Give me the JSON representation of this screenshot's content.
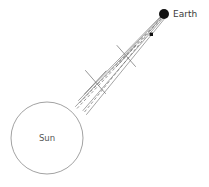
{
  "figure": {
    "kind": "astronomy-diagram",
    "background_color": "#ffffff",
    "width": 209,
    "height": 187
  },
  "sun": {
    "label": "Sun",
    "center_x": 47,
    "center_y": 138,
    "radius": 36,
    "stroke_color": "#8a8a8a",
    "fill_color": "#ffffff",
    "label_x": 47,
    "label_y": 141
  },
  "earth": {
    "label": "Earth",
    "marker_x": 164,
    "marker_y": 14,
    "marker_radius": 5,
    "marker_color": "#111111",
    "label_x": 173,
    "label_y": 17
  },
  "probe": {
    "label": "",
    "marker_x": 151,
    "marker_y": 34,
    "marker_size": 3,
    "marker_color": "#111111"
  },
  "beam": {
    "stroke_color": "#7d7d7d",
    "dash_color": "#6e6e6e",
    "stroke_width": 0.7,
    "dash_pattern": "3,2.2",
    "solid_edges": [
      {
        "x1": 76,
        "y1": 104,
        "x2": 163,
        "y2": 16
      },
      {
        "x1": 86,
        "y1": 114,
        "x2": 165,
        "y2": 18
      },
      {
        "x1": 82,
        "y1": 101,
        "x2": 163,
        "y2": 15
      }
    ],
    "dashed_rays": [
      {
        "x1": 80,
        "y1": 110,
        "x2": 163,
        "y2": 17
      },
      {
        "x1": 84,
        "y1": 107,
        "x2": 164,
        "y2": 16
      },
      {
        "x1": 78,
        "y1": 107,
        "x2": 164,
        "y2": 17
      }
    ],
    "crossings": [
      {
        "x": 95,
        "y": 82
      },
      {
        "x": 126,
        "y": 56
      }
    ]
  },
  "colors": {
    "line": "#7d7d7d",
    "marker": "#111111",
    "text": "#3a3a3a"
  }
}
